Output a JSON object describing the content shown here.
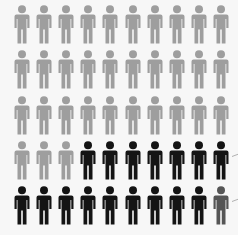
{
  "chart_data": {
    "type": "pictogram",
    "title": "",
    "rows": 5,
    "columns": 10,
    "total": 50,
    "categories": [
      "light-grey",
      "black",
      "dark-grey"
    ],
    "values": [
      33,
      16,
      1
    ],
    "colors": {
      "light-grey": "#9e9e9e",
      "black": "#141414",
      "dark-grey": "#555555"
    },
    "grid": [
      [
        "light-grey",
        "light-grey",
        "light-grey",
        "light-grey",
        "light-grey",
        "light-grey",
        "light-grey",
        "light-grey",
        "light-grey",
        "light-grey"
      ],
      [
        "light-grey",
        "light-grey",
        "light-grey",
        "light-grey",
        "light-grey",
        "light-grey",
        "light-grey",
        "light-grey",
        "light-grey",
        "light-grey"
      ],
      [
        "light-grey",
        "light-grey",
        "light-grey",
        "light-grey",
        "light-grey",
        "light-grey",
        "light-grey",
        "light-grey",
        "light-grey",
        "light-grey"
      ],
      [
        "light-grey",
        "light-grey",
        "light-grey",
        "black",
        "black",
        "black",
        "black",
        "black",
        "black",
        "black"
      ],
      [
        "black",
        "black",
        "black",
        "black",
        "black",
        "black",
        "black",
        "black",
        "black",
        "dark-grey"
      ]
    ],
    "annotations": [
      {
        "type": "pointer-line",
        "row": 4
      },
      {
        "type": "pointer-line",
        "row": 5
      }
    ]
  }
}
